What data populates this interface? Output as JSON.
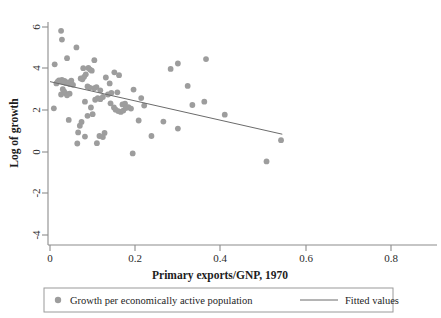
{
  "chart_data": {
    "type": "scatter",
    "title": "",
    "xlabel": "Primary exports/GNP, 1970",
    "ylabel": "Log of growth",
    "xlim": [
      -0.02,
      0.9
    ],
    "ylim": [
      -4.4,
      6.4
    ],
    "xticks": [
      0,
      0.2,
      0.4,
      0.6,
      0.8
    ],
    "xticklabels": [
      "0",
      "0.2",
      "0.4",
      "0.6",
      "0.8"
    ],
    "yticks": [
      -4,
      -2,
      0,
      2,
      4,
      6
    ],
    "yticklabels": [
      "-4",
      "-2",
      "0",
      "2",
      "4",
      "6"
    ],
    "grid": false,
    "legend_position": "below",
    "marker_color": "#9d9d9d",
    "line_color": "#6b6b6b",
    "axis_color": "#8c8c8c",
    "series": [
      {
        "name": "Growth per economically active population",
        "type": "scatter",
        "points": [
          [
            0.026,
            5.72
          ],
          [
            0.028,
            5.09
          ],
          [
            0.062,
            4.52
          ],
          [
            0.04,
            3.75
          ],
          [
            0.011,
            3.3
          ],
          [
            0.104,
            3.6
          ],
          [
            0.283,
            2.97
          ],
          [
            0.3,
            3.36
          ],
          [
            0.366,
            3.68
          ],
          [
            0.078,
            3.02
          ],
          [
            0.09,
            3.04
          ],
          [
            0.094,
            2.92
          ],
          [
            0.098,
            2.84
          ],
          [
            0.084,
            2.58
          ],
          [
            0.131,
            2.35
          ],
          [
            0.151,
            2.72
          ],
          [
            0.162,
            2.52
          ],
          [
            0.072,
            2.28
          ],
          [
            0.076,
            2.22
          ],
          [
            0.08,
            2.4
          ],
          [
            0.021,
            2.14
          ],
          [
            0.024,
            2.08
          ],
          [
            0.028,
            2.18
          ],
          [
            0.031,
            2.02
          ],
          [
            0.034,
            2.1
          ],
          [
            0.037,
            1.96
          ],
          [
            0.018,
            2.05
          ],
          [
            0.015,
            1.92
          ],
          [
            0.042,
            2.0
          ],
          [
            0.046,
            1.88
          ],
          [
            0.05,
            2.12
          ],
          [
            0.054,
            1.82
          ],
          [
            0.088,
            1.7
          ],
          [
            0.093,
            1.62
          ],
          [
            0.104,
            1.58
          ],
          [
            0.109,
            1.66
          ],
          [
            0.118,
            1.42
          ],
          [
            0.14,
            1.92
          ],
          [
            0.144,
            1.24
          ],
          [
            0.158,
            1.28
          ],
          [
            0.196,
            1.48
          ],
          [
            0.323,
            1.74
          ],
          [
            0.03,
            1.5
          ],
          [
            0.033,
            1.34
          ],
          [
            0.036,
            1.22
          ],
          [
            0.026,
            1.12
          ],
          [
            0.04,
            1.06
          ],
          [
            0.046,
            1.18
          ],
          [
            0.082,
            0.6
          ],
          [
            0.106,
            0.74
          ],
          [
            0.112,
            0.86
          ],
          [
            0.118,
            0.78
          ],
          [
            0.124,
            0.94
          ],
          [
            0.136,
            1.12
          ],
          [
            0.142,
            0.48
          ],
          [
            0.17,
            0.4
          ],
          [
            0.176,
            0.46
          ],
          [
            0.214,
            0.86
          ],
          [
            0.334,
            0.36
          ],
          [
            0.362,
            0.6
          ],
          [
            0.221,
            0.32
          ],
          [
            0.15,
            0.18
          ],
          [
            0.154,
            0.02
          ],
          [
            0.16,
            -0.08
          ],
          [
            0.166,
            -0.14
          ],
          [
            0.172,
            -0.04
          ],
          [
            0.178,
            0.14
          ],
          [
            0.184,
            0.2
          ],
          [
            0.19,
            0.1
          ],
          [
            0.096,
            0.18
          ],
          [
            0.1,
            -0.3
          ],
          [
            0.088,
            -0.42
          ],
          [
            0.009,
            0.12
          ],
          [
            0.41,
            -0.34
          ],
          [
            0.044,
            -0.72
          ],
          [
            0.074,
            -0.86
          ],
          [
            0.208,
            -0.76
          ],
          [
            0.266,
            -0.84
          ],
          [
            0.3,
            -1.34
          ],
          [
            0.07,
            -1.14
          ],
          [
            0.066,
            -1.62
          ],
          [
            0.116,
            -1.88
          ],
          [
            0.128,
            -1.66
          ],
          [
            0.124,
            -1.96
          ],
          [
            0.082,
            -1.92
          ],
          [
            0.238,
            -1.88
          ],
          [
            0.064,
            -2.42
          ],
          [
            0.11,
            -2.4
          ],
          [
            0.542,
            -2.18
          ],
          [
            0.194,
            -3.14
          ],
          [
            0.508,
            -3.72
          ]
        ]
      },
      {
        "name": "Fitted values",
        "type": "line",
        "x_start": 0.0,
        "y_start": 2.05,
        "x_end": 0.545,
        "y_end": -1.75
      }
    ],
    "legend_entries": [
      {
        "label": "Growth per economically active population",
        "marker": "circle"
      },
      {
        "label": "Fitted values",
        "marker": "line"
      }
    ]
  }
}
